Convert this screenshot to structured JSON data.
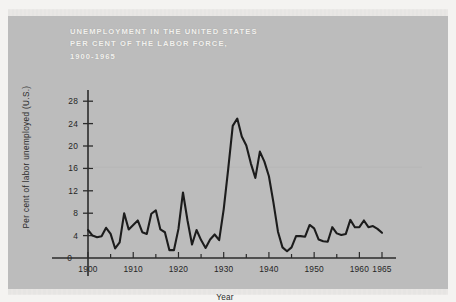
{
  "figure": {
    "title_lines": [
      "UNEMPLOYMENT IN THE UNITED STATES",
      "PER CENT OF THE LABOR FORCE,",
      "1900-1965"
    ],
    "title_color": "#f2f1ee",
    "plate_color": "#bcbcbc",
    "paper_color": "#f4f3f1",
    "line_color": "#1c1c1c",
    "axis_color": "#2b2b2b"
  },
  "chart_data": {
    "type": "line",
    "title": "UNEMPLOYMENT IN THE UNITED STATES PER CENT OF THE LABOR FORCE, 1900-1965",
    "xlabel": "Year",
    "ylabel": "Per cent of labor unemployed (U.S.)",
    "xlim": [
      1900,
      1965
    ],
    "ylim": [
      0,
      30
    ],
    "yticks": [
      0,
      4,
      8,
      12,
      16,
      20,
      24,
      28
    ],
    "ytick_labels": [
      "0",
      "4",
      "8",
      "12",
      "16",
      "20",
      "24",
      "28"
    ],
    "xticks": [
      1900,
      1910,
      1920,
      1930,
      1940,
      1950,
      1960,
      1965
    ],
    "xtick_labels": [
      "1900",
      "1910",
      "1920",
      "1930",
      "1940",
      "1950",
      "1960",
      "1965"
    ],
    "grid": false,
    "legend": null,
    "series": [
      {
        "name": "Per cent of labor unemployed (U.S.)",
        "x": [
          1900,
          1901,
          1902,
          1903,
          1904,
          1905,
          1906,
          1907,
          1908,
          1909,
          1910,
          1911,
          1912,
          1913,
          1914,
          1915,
          1916,
          1917,
          1918,
          1919,
          1920,
          1921,
          1922,
          1923,
          1924,
          1925,
          1926,
          1927,
          1928,
          1929,
          1930,
          1931,
          1932,
          1933,
          1934,
          1935,
          1936,
          1937,
          1938,
          1939,
          1940,
          1941,
          1942,
          1943,
          1944,
          1945,
          1946,
          1947,
          1948,
          1949,
          1950,
          1951,
          1952,
          1953,
          1954,
          1955,
          1956,
          1957,
          1958,
          1959,
          1960,
          1961,
          1962,
          1963,
          1964,
          1965
        ],
        "values": [
          5.0,
          4.0,
          3.7,
          3.9,
          5.4,
          4.3,
          1.7,
          2.8,
          8.0,
          5.1,
          5.9,
          6.7,
          4.6,
          4.3,
          7.9,
          8.5,
          5.1,
          4.6,
          1.4,
          1.4,
          5.2,
          11.7,
          6.7,
          2.4,
          5.0,
          3.2,
          1.8,
          3.3,
          4.2,
          3.2,
          8.7,
          15.9,
          23.6,
          24.9,
          21.7,
          20.1,
          16.9,
          14.3,
          19.0,
          17.2,
          14.6,
          9.9,
          4.7,
          1.9,
          1.2,
          1.9,
          3.9,
          3.9,
          3.8,
          5.9,
          5.3,
          3.3,
          3.0,
          2.9,
          5.5,
          4.4,
          4.1,
          4.3,
          6.8,
          5.5,
          5.5,
          6.7,
          5.5,
          5.7,
          5.2,
          4.5
        ]
      }
    ]
  }
}
